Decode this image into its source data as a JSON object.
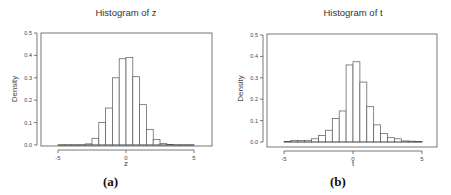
{
  "chart_data": [
    {
      "type": "bar",
      "title": "Histogram of z",
      "xlabel": "z",
      "ylabel": "Density",
      "caption": "(a)",
      "xlim": [
        -6,
        6.5
      ],
      "ylim": [
        0,
        0.5
      ],
      "xticks": [
        -5,
        0,
        5
      ],
      "yticks": [
        0.0,
        0.1,
        0.2,
        0.3,
        0.4,
        0.5
      ],
      "ytick_labels": [
        "0.0",
        "0.1",
        "0.2",
        "0.3",
        "0.4",
        "0.5"
      ],
      "bin_width": 0.5,
      "bin_starts": [
        -5,
        -4.5,
        -4,
        -3.5,
        -3,
        -2.5,
        -2,
        -1.5,
        -1,
        -0.5,
        0,
        0.5,
        1,
        1.5,
        2,
        2.5,
        3,
        3.5,
        4,
        4.5
      ],
      "values": [
        0.001,
        0.001,
        0.001,
        0.001,
        0.005,
        0.03,
        0.1,
        0.165,
        0.3,
        0.385,
        0.39,
        0.305,
        0.18,
        0.07,
        0.025,
        0.006,
        0.003,
        0.001,
        0.001,
        0.001
      ],
      "grid": false
    },
    {
      "type": "bar",
      "title": "Histogram of t",
      "xlabel": "t",
      "ylabel": "Density",
      "caption": "(b)",
      "xlim": [
        -6,
        6.5
      ],
      "ylim": [
        0,
        0.5
      ],
      "xticks": [
        -5,
        0,
        5
      ],
      "yticks": [
        0.0,
        0.1,
        0.2,
        0.3,
        0.4,
        0.5
      ],
      "ytick_labels": [
        "0.0",
        "0.1",
        "0.2",
        "0.3",
        "0.4",
        "0.5"
      ],
      "bin_width": 0.5,
      "bin_starts": [
        -5,
        -4.5,
        -4,
        -3.5,
        -3,
        -2.5,
        -2,
        -1.5,
        -1,
        -0.5,
        0,
        0.5,
        1,
        1.5,
        2,
        2.5,
        3,
        3.5,
        4,
        4.5
      ],
      "values": [
        0.003,
        0.007,
        0.007,
        0.008,
        0.015,
        0.03,
        0.055,
        0.11,
        0.145,
        0.36,
        0.375,
        0.28,
        0.165,
        0.08,
        0.04,
        0.02,
        0.015,
        0.005,
        0.004,
        0.002
      ],
      "grid": false
    }
  ]
}
